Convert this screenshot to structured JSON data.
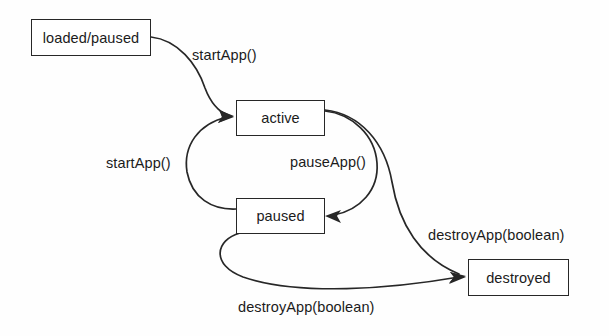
{
  "diagram": {
    "type": "state-transition-diagram",
    "background_color": "#fefefe",
    "stroke_color": "#272727",
    "text_color": "#1b1b1b",
    "states": [
      {
        "id": "loaded_paused",
        "label": "loaded/paused",
        "x": 31,
        "y": 19,
        "w": 120,
        "h": 37
      },
      {
        "id": "active",
        "label": "active",
        "x": 236,
        "y": 100,
        "w": 89,
        "h": 36
      },
      {
        "id": "paused",
        "label": "paused",
        "x": 236,
        "y": 198,
        "w": 89,
        "h": 36
      },
      {
        "id": "destroyed",
        "label": "destroyed",
        "x": 468,
        "y": 259,
        "w": 101,
        "h": 37
      }
    ],
    "transitions": [
      {
        "id": "t1",
        "from": "loaded_paused",
        "to": "active",
        "label": "startApp()",
        "label_x": 192,
        "label_y": 47
      },
      {
        "id": "t2",
        "from": "paused",
        "to": "active",
        "label": "startApp()",
        "label_x": 106,
        "label_y": 155
      },
      {
        "id": "t3",
        "from": "active",
        "to": "paused",
        "label": "pauseApp()",
        "label_x": 290,
        "label_y": 154
      },
      {
        "id": "t4",
        "from": "active",
        "to": "destroyed",
        "label": "destroyApp(boolean)",
        "label_x": 428,
        "label_y": 227
      },
      {
        "id": "t5",
        "from": "paused",
        "to": "destroyed",
        "label": "destroyApp(boolean)",
        "label_x": 238,
        "label_y": 299
      }
    ]
  }
}
